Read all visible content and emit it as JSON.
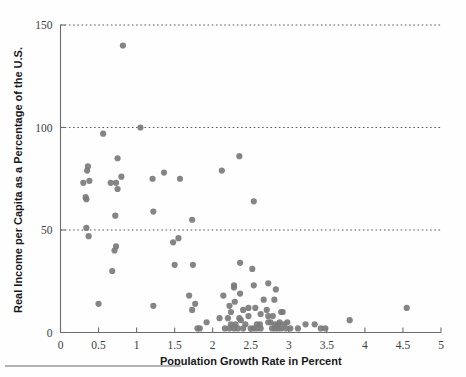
{
  "chart_data": {
    "type": "scatter",
    "title": "",
    "xlabel": "Population Growth Rate in Percent",
    "ylabel": "Real Income per Capita as a Percentage of the U.S.",
    "xlim": [
      0,
      5
    ],
    "ylim": [
      0,
      150
    ],
    "xticks": [
      0,
      0.5,
      1,
      1.5,
      2,
      2.5,
      3,
      3.5,
      4,
      4.5,
      5
    ],
    "xticklabels": [
      "0",
      "0.5",
      "1",
      "1.5",
      "2",
      "2.5",
      "3",
      "3.5",
      "4",
      "4.5",
      "5"
    ],
    "yticks": [
      0,
      50,
      100,
      150
    ],
    "yticklabels": [
      "0",
      "50",
      "100",
      "150"
    ],
    "grid": "horizontal-dotted-at-50-100-150",
    "legend": null,
    "marker": {
      "shape": "circle",
      "color": "#7b7b7b",
      "size": 3.1
    },
    "series": [
      {
        "name": "countries",
        "points": [
          [
            0.82,
            140
          ],
          [
            1.05,
            100
          ],
          [
            0.56,
            97
          ],
          [
            0.75,
            85
          ],
          [
            0.36,
            81
          ],
          [
            0.35,
            79
          ],
          [
            2.35,
            86
          ],
          [
            2.12,
            79
          ],
          [
            1.36,
            78
          ],
          [
            0.8,
            76
          ],
          [
            0.38,
            74
          ],
          [
            0.3,
            73
          ],
          [
            1.21,
            75
          ],
          [
            1.57,
            75
          ],
          [
            0.66,
            73
          ],
          [
            0.73,
            73
          ],
          [
            0.75,
            70
          ],
          [
            0.33,
            66
          ],
          [
            0.34,
            65
          ],
          [
            2.54,
            64
          ],
          [
            1.22,
            59
          ],
          [
            0.72,
            57
          ],
          [
            1.73,
            55
          ],
          [
            0.34,
            51
          ],
          [
            0.37,
            47
          ],
          [
            1.55,
            46
          ],
          [
            1.48,
            44
          ],
          [
            0.73,
            42
          ],
          [
            0.71,
            40
          ],
          [
            2.36,
            34
          ],
          [
            1.74,
            33
          ],
          [
            1.5,
            33
          ],
          [
            0.68,
            30
          ],
          [
            2.52,
            31
          ],
          [
            2.73,
            24
          ],
          [
            2.54,
            23
          ],
          [
            2.28,
            23
          ],
          [
            2.28,
            22
          ],
          [
            2.83,
            21
          ],
          [
            2.36,
            19
          ],
          [
            2.14,
            18
          ],
          [
            1.69,
            18
          ],
          [
            2.67,
            16
          ],
          [
            2.81,
            16
          ],
          [
            2.29,
            15
          ],
          [
            0.5,
            14
          ],
          [
            1.22,
            13
          ],
          [
            1.77,
            14
          ],
          [
            2.22,
            13
          ],
          [
            2.47,
            12
          ],
          [
            2.56,
            12
          ],
          [
            2.71,
            11
          ],
          [
            1.73,
            11
          ],
          [
            4.55,
            12
          ],
          [
            2.24,
            10
          ],
          [
            2.4,
            11
          ],
          [
            2.9,
            10
          ],
          [
            2.92,
            10
          ],
          [
            2.63,
            9
          ],
          [
            2.47,
            8
          ],
          [
            2.73,
            8
          ],
          [
            2.79,
            8
          ],
          [
            2.35,
            7
          ],
          [
            2.09,
            7
          ],
          [
            2.2,
            7
          ],
          [
            2.37,
            6
          ],
          [
            1.92,
            5
          ],
          [
            3.8,
            6
          ],
          [
            2.73,
            5
          ],
          [
            2.76,
            5
          ],
          [
            2.88,
            5
          ],
          [
            2.98,
            5
          ],
          [
            2.24,
            4
          ],
          [
            2.3,
            4
          ],
          [
            2.43,
            4
          ],
          [
            2.58,
            4
          ],
          [
            2.62,
            4
          ],
          [
            2.82,
            4
          ],
          [
            2.86,
            4
          ],
          [
            2.94,
            4
          ],
          [
            3.22,
            4
          ],
          [
            3.34,
            4
          ],
          [
            1.8,
            2
          ],
          [
            1.83,
            2
          ],
          [
            2.16,
            2
          ],
          [
            2.22,
            2
          ],
          [
            2.28,
            2
          ],
          [
            2.33,
            2
          ],
          [
            2.4,
            2
          ],
          [
            2.5,
            2
          ],
          [
            2.54,
            2
          ],
          [
            2.58,
            2
          ],
          [
            2.63,
            2
          ],
          [
            2.78,
            2
          ],
          [
            2.82,
            2
          ],
          [
            2.86,
            2
          ],
          [
            2.9,
            2
          ],
          [
            2.96,
            2
          ],
          [
            3.02,
            2
          ],
          [
            3.12,
            2
          ],
          [
            3.42,
            2
          ],
          [
            3.48,
            2
          ]
        ]
      }
    ]
  }
}
